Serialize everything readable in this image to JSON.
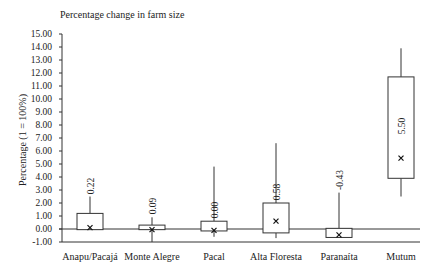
{
  "chart_data": {
    "type": "box",
    "title": "Percentage change in farm size",
    "xlabel": "",
    "ylabel": "Percentage (1 = 100%)",
    "ylim": [
      -1.0,
      15.0
    ],
    "yticks": [
      "15.00",
      "14.00",
      "13.00",
      "12.00",
      "11.00",
      "10.00",
      "9.00",
      "8.00",
      "7.00",
      "6.00",
      "5.00",
      "4.00",
      "3.00",
      "2.00",
      "1.00",
      "0.00",
      "-1.00"
    ],
    "grid": false,
    "legend": null,
    "categories": [
      "Anapu/Pacajá",
      "Monte  Alegre",
      "Pacal",
      "Alta Floresta",
      "Paranaíta",
      "Mutum"
    ],
    "series": [
      {
        "name": "Anapu/Pacajá",
        "whisker_low": -0.05,
        "q1": -0.05,
        "q3": 1.2,
        "whisker_high": 2.5,
        "mean": 0.1,
        "median_label": "0.22"
      },
      {
        "name": "Monte Alegre",
        "whisker_low": -1.0,
        "q1": -0.05,
        "q3": 0.3,
        "whisker_high": 0.9,
        "mean": -0.05,
        "median_label": "0.09"
      },
      {
        "name": "Pacal",
        "whisker_low": -0.6,
        "q1": -0.15,
        "q3": 0.6,
        "whisker_high": 4.8,
        "mean": -0.1,
        "median_label": "0.00"
      },
      {
        "name": "Alta Floresta",
        "whisker_low": -0.7,
        "q1": -0.3,
        "q3": 2.0,
        "whisker_high": 6.6,
        "mean": 0.6,
        "median_label": "0.58"
      },
      {
        "name": "Paranaíta",
        "whisker_low": -0.65,
        "q1": -0.65,
        "q3": 0.05,
        "whisker_high": 2.8,
        "mean": -0.45,
        "median_label": "-0.43"
      },
      {
        "name": "Mutum",
        "whisker_low": 2.5,
        "q1": 3.9,
        "q3": 11.7,
        "whisker_high": 13.9,
        "mean": 5.45,
        "median_label": "5.50"
      }
    ],
    "reference_line": 0.0
  },
  "labels": {
    "title": "Percentage change in farm size",
    "ylabel": "Percentage (1 = 100%)"
  }
}
